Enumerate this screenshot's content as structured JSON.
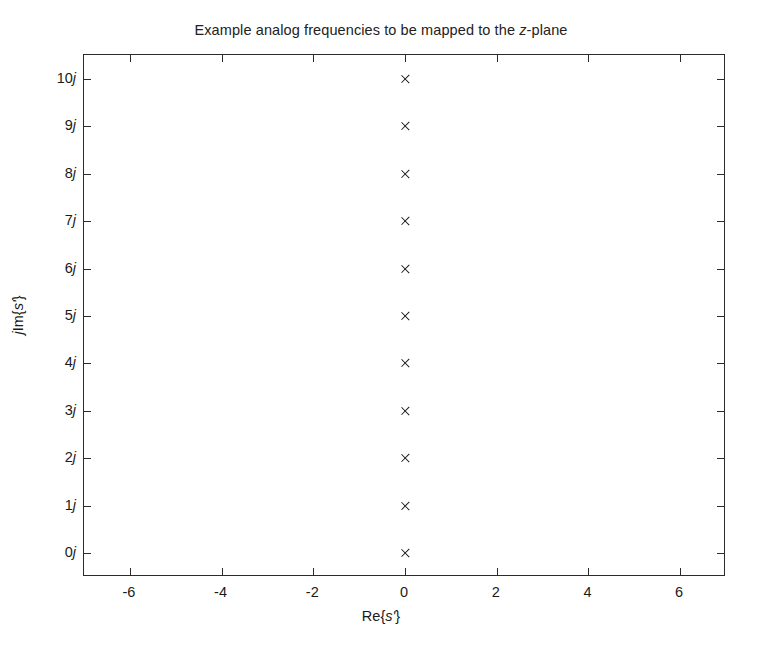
{
  "chart_data": {
    "type": "scatter",
    "title": "Example analog frequencies to be mapped to the z-plane",
    "title_parts": [
      {
        "text": "Example analog frequencies to be mapped to the ",
        "italic": false
      },
      {
        "text": "z",
        "italic": true
      },
      {
        "text": "-plane",
        "italic": false
      }
    ],
    "xlabel": "Re{s'}",
    "xlabel_parts": [
      {
        "text": "Re{",
        "italic": false
      },
      {
        "text": "s'",
        "italic": true
      },
      {
        "text": "}",
        "italic": false
      }
    ],
    "ylabel": "jIm{s'}",
    "ylabel_parts": [
      {
        "text": "j",
        "italic": true
      },
      {
        "text": "Im{",
        "italic": false
      },
      {
        "text": "s'",
        "italic": true
      },
      {
        "text": "}",
        "italic": false
      }
    ],
    "xlim": [
      -7,
      7
    ],
    "ylim": [
      -0.5,
      10.5
    ],
    "xticks": [
      -6,
      -4,
      -2,
      0,
      2,
      4,
      6
    ],
    "xticklabels": [
      "-6",
      "-4",
      "-2",
      "0",
      "2",
      "4",
      "6"
    ],
    "yticks": [
      0,
      1,
      2,
      3,
      4,
      5,
      6,
      7,
      8,
      9,
      10
    ],
    "yticklabels": [
      "0j",
      "1j",
      "2j",
      "3j",
      "4j",
      "5j",
      "6j",
      "7j",
      "8j",
      "9j",
      "10j"
    ],
    "grid": false,
    "legend": null,
    "marker": "x",
    "marker_color": "#1a1a1a",
    "series": [
      {
        "name": "analog frequencies",
        "x": [
          0,
          0,
          0,
          0,
          0,
          0,
          0,
          0,
          0,
          0,
          0
        ],
        "y": [
          0,
          1,
          2,
          3,
          4,
          5,
          6,
          7,
          8,
          9,
          10
        ]
      }
    ]
  },
  "figure": {
    "background": "#ffffff",
    "axis_color": "#2b2b2b",
    "text_color": "#1a1a1a"
  }
}
